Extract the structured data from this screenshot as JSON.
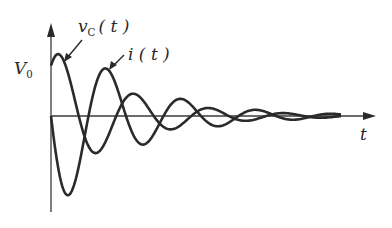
{
  "chart_data": {
    "type": "line",
    "title": "",
    "xlabel": "t",
    "ylabel": "",
    "grid": false,
    "legend": "inline annotations with arrows",
    "y_tick_labels": [
      "V0"
    ],
    "annotations": [
      {
        "text": "vc(t)",
        "points_to": "first peak of vc(t)"
      },
      {
        "text": "i(t)",
        "points_to": "first peak of i(t)"
      }
    ],
    "axes_px": {
      "origin_x": 51,
      "origin_y": 116,
      "x_end": 376,
      "y_top": 24,
      "y_bottom": 212
    },
    "series": [
      {
        "name": "vc(t)",
        "description": "damped oscillation starting at V0, decaying to 0",
        "model": "y = B*exp(-alpha*x)*cos(omega*(x - x0))",
        "params": {
          "B": 69,
          "alpha": 0.0136,
          "period_px": 75,
          "x0": 9
        },
        "extrema_px": [
          [
            0,
            72
          ],
          [
            9,
            55
          ],
          [
            42,
            153
          ],
          [
            86,
            97
          ],
          [
            119,
            128
          ],
          [
            159,
            109
          ]
        ]
      },
      {
        "name": "i(t)",
        "description": "damped oscillation starting at 0, first going negative",
        "model": "y = -A*exp(-alpha*x)*sin(omega*x)",
        "params": {
          "A": 101,
          "alpha": 0.0136,
          "period_px": 75
        },
        "extrema_px": [
          [
            0,
            116
          ],
          [
            18,
            195
          ],
          [
            56,
            69
          ],
          [
            92,
            146
          ],
          [
            129,
            99
          ],
          [
            164,
            124
          ]
        ]
      }
    ],
    "x_range_px": [
      0,
      290
    ]
  },
  "labels": {
    "v0_main": "V",
    "v0_sub": "0",
    "vc_main": "v",
    "vc_sub": "C",
    "vc_args": "( t )",
    "i_label": "i ( t )",
    "t_label": "t"
  },
  "colors": {
    "ink": "#2a2a2a",
    "axis": "#3a3a3a",
    "background": "#ffffff"
  }
}
